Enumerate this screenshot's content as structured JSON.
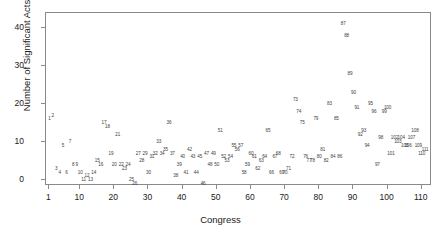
{
  "chart_data": {
    "type": "scatter",
    "title": "",
    "xlabel": "Congress",
    "ylabel": "Number of Significant Acts",
    "xlim": [
      0,
      113
    ],
    "ylim": [
      -1.5,
      44
    ],
    "grid": false,
    "legend": null,
    "point_label_mode": "congress-number",
    "xticks": [
      1,
      10,
      20,
      30,
      40,
      50,
      60,
      70,
      80,
      90,
      100,
      110
    ],
    "xtick_labels": [
      "1",
      "10",
      "20",
      "30",
      "40",
      "50",
      "60",
      "70",
      "80",
      "90",
      "100",
      "110"
    ],
    "yticks": [
      0,
      10,
      20,
      30,
      40
    ],
    "ytick_labels": [
      "0",
      "10",
      "20",
      "30",
      "40"
    ],
    "marker_color": "#3d3d3d",
    "frame_color": "#8a8a8a",
    "background": "#ffffff",
    "points": [
      {
        "label": "1",
        "x": 1,
        "y": 16
      },
      {
        "label": "2",
        "x": 2,
        "y": 17
      },
      {
        "label": "3",
        "x": 3,
        "y": 3
      },
      {
        "label": "4",
        "x": 4,
        "y": 2
      },
      {
        "label": "5",
        "x": 5,
        "y": 9
      },
      {
        "label": "6",
        "x": 6,
        "y": 2
      },
      {
        "label": "7",
        "x": 7,
        "y": 10
      },
      {
        "label": "8",
        "x": 8,
        "y": 4
      },
      {
        "label": "9",
        "x": 9,
        "y": 4
      },
      {
        "label": "10",
        "x": 10,
        "y": 2
      },
      {
        "label": "11",
        "x": 11,
        "y": 0
      },
      {
        "label": "12",
        "x": 12,
        "y": 1
      },
      {
        "label": "13",
        "x": 13,
        "y": 0
      },
      {
        "label": "14",
        "x": 14,
        "y": 2
      },
      {
        "label": "15",
        "x": 15,
        "y": 5
      },
      {
        "label": "16",
        "x": 16,
        "y": 4
      },
      {
        "label": "17",
        "x": 17,
        "y": 15
      },
      {
        "label": "18",
        "x": 18,
        "y": 14
      },
      {
        "label": "19",
        "x": 19,
        "y": 7
      },
      {
        "label": "20",
        "x": 20,
        "y": 4
      },
      {
        "label": "21",
        "x": 21,
        "y": 12
      },
      {
        "label": "22",
        "x": 22,
        "y": 4
      },
      {
        "label": "23",
        "x": 23,
        "y": 3
      },
      {
        "label": "24",
        "x": 24,
        "y": 4
      },
      {
        "label": "25",
        "x": 25,
        "y": 0
      },
      {
        "label": "26",
        "x": 26,
        "y": -1
      },
      {
        "label": "27",
        "x": 27,
        "y": 7
      },
      {
        "label": "28",
        "x": 28,
        "y": 5
      },
      {
        "label": "29",
        "x": 29,
        "y": 7
      },
      {
        "label": "30",
        "x": 30,
        "y": 2
      },
      {
        "label": "31",
        "x": 31,
        "y": 6
      },
      {
        "label": "32",
        "x": 32,
        "y": 7
      },
      {
        "label": "33",
        "x": 33,
        "y": 10
      },
      {
        "label": "34",
        "x": 34,
        "y": 7
      },
      {
        "label": "35",
        "x": 35,
        "y": 8
      },
      {
        "label": "36",
        "x": 36,
        "y": 15
      },
      {
        "label": "37",
        "x": 37,
        "y": 7
      },
      {
        "label": "38",
        "x": 38,
        "y": 1
      },
      {
        "label": "39",
        "x": 39,
        "y": 4
      },
      {
        "label": "40",
        "x": 40,
        "y": 6
      },
      {
        "label": "41",
        "x": 41,
        "y": 2
      },
      {
        "label": "42",
        "x": 42,
        "y": 8
      },
      {
        "label": "43",
        "x": 43,
        "y": 6
      },
      {
        "label": "44",
        "x": 44,
        "y": 2
      },
      {
        "label": "45",
        "x": 45,
        "y": 6
      },
      {
        "label": "46",
        "x": 46,
        "y": -1
      },
      {
        "label": "47",
        "x": 47,
        "y": 7
      },
      {
        "label": "48",
        "x": 48,
        "y": 4
      },
      {
        "label": "49",
        "x": 49,
        "y": 7
      },
      {
        "label": "50",
        "x": 50,
        "y": 4
      },
      {
        "label": "51",
        "x": 51,
        "y": 13
      },
      {
        "label": "52",
        "x": 52,
        "y": 6
      },
      {
        "label": "53",
        "x": 53,
        "y": 5
      },
      {
        "label": "54",
        "x": 54,
        "y": 6
      },
      {
        "label": "55",
        "x": 55,
        "y": 9
      },
      {
        "label": "56",
        "x": 56,
        "y": 8
      },
      {
        "label": "57",
        "x": 57,
        "y": 9
      },
      {
        "label": "58",
        "x": 58,
        "y": 2
      },
      {
        "label": "59",
        "x": 59,
        "y": 4
      },
      {
        "label": "60",
        "x": 60,
        "y": 7
      },
      {
        "label": "61",
        "x": 61,
        "y": 6
      },
      {
        "label": "62",
        "x": 62,
        "y": 3
      },
      {
        "label": "63",
        "x": 63,
        "y": 5
      },
      {
        "label": "64",
        "x": 64,
        "y": 6
      },
      {
        "label": "65",
        "x": 65,
        "y": 13
      },
      {
        "label": "66",
        "x": 66,
        "y": 2
      },
      {
        "label": "67",
        "x": 67,
        "y": 6
      },
      {
        "label": "68",
        "x": 68,
        "y": 7
      },
      {
        "label": "69",
        "x": 69,
        "y": 2
      },
      {
        "label": "70",
        "x": 70,
        "y": 2
      },
      {
        "label": "71",
        "x": 71,
        "y": 3
      },
      {
        "label": "72",
        "x": 72,
        "y": 6
      },
      {
        "label": "73",
        "x": 73,
        "y": 21
      },
      {
        "label": "74",
        "x": 74,
        "y": 18
      },
      {
        "label": "75",
        "x": 75,
        "y": 15
      },
      {
        "label": "76",
        "x": 76,
        "y": 6
      },
      {
        "label": "77",
        "x": 77,
        "y": 5
      },
      {
        "label": "78",
        "x": 78,
        "y": 5
      },
      {
        "label": "79",
        "x": 79,
        "y": 16
      },
      {
        "label": "80",
        "x": 80,
        "y": 6
      },
      {
        "label": "81",
        "x": 81,
        "y": 8
      },
      {
        "label": "82",
        "x": 82,
        "y": 5
      },
      {
        "label": "83",
        "x": 83,
        "y": 20
      },
      {
        "label": "84",
        "x": 84,
        "y": 6
      },
      {
        "label": "85",
        "x": 85,
        "y": 16
      },
      {
        "label": "86",
        "x": 86,
        "y": 6
      },
      {
        "label": "87",
        "x": 87,
        "y": 41
      },
      {
        "label": "88",
        "x": 88,
        "y": 38
      },
      {
        "label": "89",
        "x": 89,
        "y": 28
      },
      {
        "label": "90",
        "x": 90,
        "y": 23
      },
      {
        "label": "91",
        "x": 91,
        "y": 19
      },
      {
        "label": "92",
        "x": 92,
        "y": 12
      },
      {
        "label": "93",
        "x": 93,
        "y": 13
      },
      {
        "label": "94",
        "x": 94,
        "y": 9
      },
      {
        "label": "95",
        "x": 95,
        "y": 20
      },
      {
        "label": "96",
        "x": 96,
        "y": 18
      },
      {
        "label": "97",
        "x": 97,
        "y": 4
      },
      {
        "label": "98",
        "x": 98,
        "y": 11
      },
      {
        "label": "99",
        "x": 99,
        "y": 18
      },
      {
        "label": "100",
        "x": 100,
        "y": 19
      },
      {
        "label": "101",
        "x": 101,
        "y": 7
      },
      {
        "label": "102",
        "x": 102,
        "y": 11
      },
      {
        "label": "103",
        "x": 103,
        "y": 10
      },
      {
        "label": "104",
        "x": 104,
        "y": 11
      },
      {
        "label": "105",
        "x": 105,
        "y": 9
      },
      {
        "label": "106",
        "x": 106,
        "y": 9
      },
      {
        "label": "107",
        "x": 107,
        "y": 11
      },
      {
        "label": "108",
        "x": 108,
        "y": 13
      },
      {
        "label": "109",
        "x": 109,
        "y": 9
      },
      {
        "label": "110",
        "x": 110,
        "y": 7
      },
      {
        "label": "111",
        "x": 111,
        "y": 8
      }
    ]
  }
}
